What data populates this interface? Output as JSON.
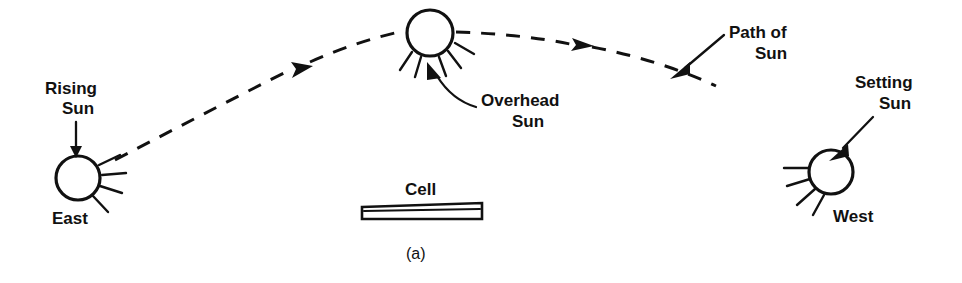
{
  "figure": {
    "caption": "(a)",
    "background_color": "#ffffff",
    "ink_color": "#111111"
  },
  "labels": {
    "rising_sun_line1": "Rising",
    "rising_sun_line2": "Sun",
    "east": "East",
    "overhead_sun_line1": "Overhead",
    "overhead_sun_line2": "Sun",
    "path_of_sun_line1": "Path of",
    "path_of_sun_line2": "Sun",
    "setting_sun_line1": "Setting",
    "setting_sun_line2": "Sun",
    "west": "West",
    "cell": "Cell"
  },
  "elements": {
    "rising_sun_icon": "sun-icon",
    "overhead_sun_icon": "sun-icon",
    "setting_sun_icon": "sun-icon",
    "path_icon": "dashed-arc-icon",
    "cell_icon": "solar-cell-slab-icon"
  },
  "geometry": {
    "rising_sun": {
      "cx": 78,
      "cy": 178,
      "r": 22
    },
    "overhead_sun": {
      "cx": 430,
      "cy": 33,
      "r": 23
    },
    "setting_sun": {
      "cx": 831,
      "cy": 172,
      "r": 22
    },
    "cell": {
      "x": 362,
      "y": 203,
      "width": 120,
      "height": 17
    },
    "arc_start": {
      "x": 115,
      "y": 160
    },
    "arc_end": {
      "x": 716,
      "y": 86
    }
  }
}
